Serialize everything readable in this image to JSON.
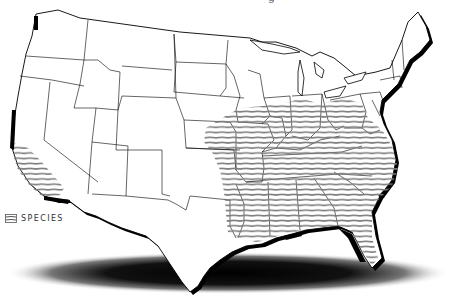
{
  "map": {
    "title_fragment": "g",
    "region": "Contiguous United States",
    "style": "state outlines with drop shadow",
    "colors": {
      "land": "#ffffff",
      "border": "#000000",
      "hatch": "#777777",
      "shadow": "#000000"
    },
    "ranges": [
      {
        "name": "California coastal range",
        "pattern": "horizontal-hatch"
      },
      {
        "name": "Eastern range",
        "pattern": "horizontal-hatch"
      }
    ]
  },
  "legend": {
    "items": [
      {
        "icon": "hatch-swatch-icon",
        "label": "SPECIES"
      }
    ]
  }
}
